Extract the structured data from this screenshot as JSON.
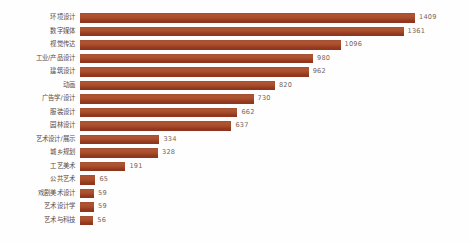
{
  "chart_data": {
    "type": "bar",
    "orientation": "horizontal",
    "title": "",
    "subtitle": "",
    "xlabel": "",
    "ylabel": "",
    "xlim": [
      0,
      1409
    ],
    "grid": false,
    "legend": null,
    "bar_color": "#a04a2b",
    "value_label_color": "#7a6458",
    "category_label_color": "#5c4a42",
    "background": "#fefefe",
    "categories": [
      "环境设计",
      "数字媒体",
      "视觉传达",
      "工业/产品设计",
      "建筑设计",
      "动画",
      "广告学/设计",
      "服装设计",
      "园林设计",
      "艺术设计/展示",
      "城乡规划",
      "工艺美术",
      "公共艺术",
      "戏剧美术设计",
      "艺术设计学",
      "艺术与科技"
    ],
    "values": [
      1409,
      1361,
      1096,
      980,
      962,
      820,
      730,
      662,
      637,
      334,
      328,
      191,
      65,
      59,
      59,
      56
    ]
  }
}
